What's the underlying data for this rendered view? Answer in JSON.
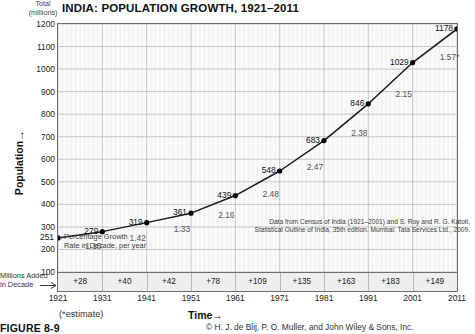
{
  "figure": {
    "title": "INDIA: POPULATION GROWTH, 1921–2011",
    "total_label_line1": "Total",
    "total_label_line2": "(millions)",
    "y_axis_title": "Population",
    "x_axis_title": "Time",
    "estimate_note": "(*estimate)",
    "figure_id": "FIGURE 8-9",
    "copyright": "© H. J. de Blij, P. O. Muller, and John Wiley & Sons, Inc.",
    "growth_note_line1": "Percentage Growth",
    "growth_note_line2": "Rate in Decade, per year",
    "added_label_line1": "Millions Added",
    "added_label_line2": "in Decade",
    "source_line1": "Data from Census of India (1921–2001) and S. Roy and R. G. Katoti,",
    "source_line2": "Statistical Outline of India, 35th edition. Mumbai: Tata Services Ltd., 2009."
  },
  "colors": {
    "line": "#1a1a1a",
    "marker": "#000000",
    "plot_bg": "#fafafa",
    "band_bg": "#eeeeee",
    "grid_major": "#b9b9b9",
    "grid_minor": "#dddddd",
    "frame": "#6d6d6d",
    "rate_text": "#555555"
  },
  "chart_data": {
    "type": "line",
    "title": "INDIA: POPULATION GROWTH, 1921–2011",
    "xlabel": "Time",
    "ylabel": "Population",
    "y_unit": "Total (millions)",
    "xlim": [
      1921,
      2011
    ],
    "ylim": [
      100,
      1200
    ],
    "yticks": [
      100,
      200,
      300,
      400,
      500,
      600,
      700,
      800,
      900,
      1000,
      1100,
      1200
    ],
    "xticks": [
      1921,
      1931,
      1941,
      1951,
      1961,
      1971,
      1981,
      1991,
      2001,
      2011
    ],
    "grid": true,
    "legend": "none",
    "x": [
      1921,
      1931,
      1941,
      1951,
      1961,
      1971,
      1981,
      1991,
      2001,
      2011
    ],
    "values": [
      251,
      279,
      319,
      361,
      439,
      548,
      683,
      846,
      1029,
      1178
    ],
    "point_labels": [
      "251",
      "279",
      "319",
      "361",
      "439",
      "548",
      "683",
      "846",
      "1029",
      "1178"
    ],
    "growth_rate_percent_per_year": [
      {
        "decade": "1921–1931",
        "label": "1.10",
        "value": 1.1
      },
      {
        "decade": "1931–1941",
        "label": "1.42",
        "value": 1.42
      },
      {
        "decade": "1941–1951",
        "label": "1.33",
        "value": 1.33
      },
      {
        "decade": "1951–1961",
        "label": "2.16",
        "value": 2.16
      },
      {
        "decade": "1961–1971",
        "label": "2.48",
        "value": 2.48
      },
      {
        "decade": "1971–1981",
        "label": "2.47",
        "value": 2.47
      },
      {
        "decade": "1981–1991",
        "label": "2.38",
        "value": 2.38
      },
      {
        "decade": "1991–2001",
        "label": "2.15",
        "value": 2.15
      },
      {
        "decade": "2001–2011",
        "label": "1.57*",
        "value": 1.57
      }
    ],
    "millions_added_in_decade": [
      {
        "decade": "1921–1931",
        "label": "+28",
        "value": 28
      },
      {
        "decade": "1931–1941",
        "label": "+40",
        "value": 40
      },
      {
        "decade": "1941–1951",
        "label": "+42",
        "value": 42
      },
      {
        "decade": "1951–1961",
        "label": "+78",
        "value": 78
      },
      {
        "decade": "1961–1971",
        "label": "+109",
        "value": 109
      },
      {
        "decade": "1971–1981",
        "label": "+135",
        "value": 135
      },
      {
        "decade": "1981–1991",
        "label": "+163",
        "value": 163
      },
      {
        "decade": "1991–2001",
        "label": "+183",
        "value": 183
      },
      {
        "decade": "2001–2011",
        "label": "+149",
        "value": 149
      }
    ],
    "annotations": [
      "Percentage Growth Rate in Decade, per year",
      "(*estimate)"
    ],
    "source": "Data from Census of India (1921–2001) and S. Roy and R. G. Katoti, Statistical Outline of India, 35th edition. Mumbai: Tata Services Ltd., 2009."
  }
}
